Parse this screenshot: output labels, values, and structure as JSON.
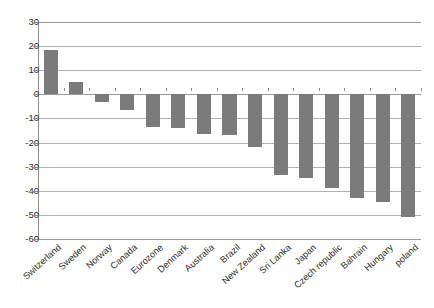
{
  "chart_data": {
    "type": "bar",
    "title": "",
    "subtitle": "",
    "xlabel": "",
    "ylabel": "",
    "ylim": [
      -60,
      30
    ],
    "ytick_step": 10,
    "yticks": [
      30,
      20,
      10,
      0,
      -10,
      -20,
      -30,
      -40,
      -50,
      -60
    ],
    "ytick_labels": [
      "30",
      "20",
      "10",
      "0",
      "-10",
      "-20",
      "-30",
      "-40",
      "-50",
      "-60"
    ],
    "grid": true,
    "grid_axis": "y",
    "legend": false,
    "legend_position": "none",
    "bar_color": "#7b7b7b",
    "plot_border_color": "#8e8e8e",
    "gridline_color": "#b0b0b0",
    "background": "#ffffff",
    "xtick_label_rotation": -42,
    "categories": [
      "Switzerland",
      "Sweden",
      "Norway",
      "Canada",
      "Eurozone",
      "Denmark",
      "Australia",
      "Brazil",
      "New Zealand",
      "Sri Lanka",
      "Japan",
      "Czech republic",
      "Bahrain",
      "Hungary",
      "poland"
    ],
    "values": [
      18.5,
      5.0,
      -3.0,
      -6.5,
      -13.5,
      -14.0,
      -16.5,
      -17.0,
      -22.0,
      -33.5,
      -34.5,
      -39.0,
      -43.0,
      -44.5,
      -51.0
    ]
  }
}
